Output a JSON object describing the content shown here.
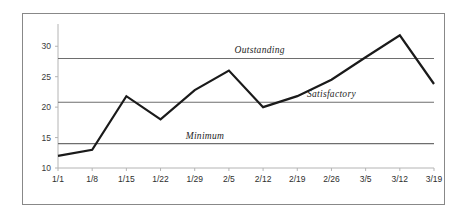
{
  "chart_data": {
    "type": "line",
    "title": "",
    "subtitle": "",
    "xlabel": "",
    "ylabel": "",
    "categories": [
      "1/1",
      "1/8",
      "1/15",
      "1/22",
      "1/29",
      "2/5",
      "2/12",
      "2/19",
      "2/26",
      "3/5",
      "3/12",
      "3/19"
    ],
    "series": [
      {
        "name": "Measurement",
        "values": [
          12,
          13,
          21.8,
          18,
          22.8,
          26,
          20,
          21.8,
          24.5,
          28.2,
          31.8,
          23.8
        ],
        "color": "#1a1a1a",
        "line_width": 2.2
      }
    ],
    "reference_lines": [
      {
        "label": "Outstanding",
        "value": 28,
        "color": "#6e6e6e",
        "label_x_category_index": 5.9
      },
      {
        "label": "Satisfactory",
        "value": 20.8,
        "color": "#6e6e6e",
        "label_x_category_index": 8.0
      },
      {
        "label": "Minimum",
        "value": 14,
        "color": "#6e6e6e",
        "label_x_category_index": 4.3
      }
    ],
    "yticks": [
      10,
      15,
      20,
      25,
      30
    ],
    "ytick_labels": [
      "10",
      "15",
      "20",
      "25",
      "30"
    ],
    "ylim": [
      10,
      33
    ],
    "xlim_categories": [
      0,
      11
    ],
    "grid": false,
    "legend": "none",
    "axis_color": "#b4b4b4",
    "background_color": "#ffffff",
    "frame_color": "#888888"
  }
}
